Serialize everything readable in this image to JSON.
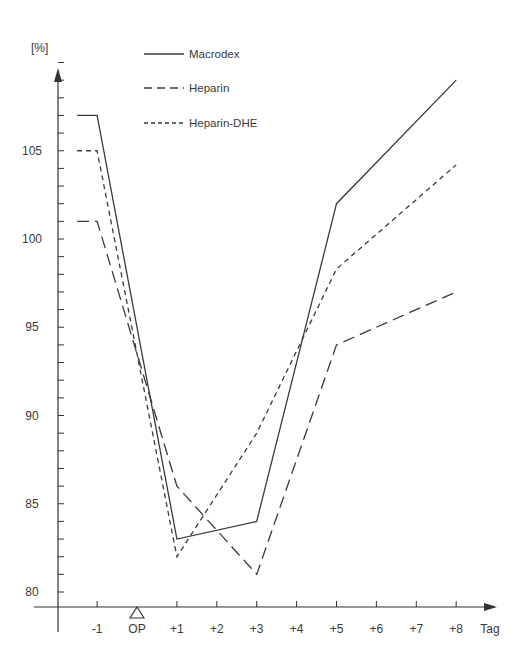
{
  "chart_data": {
    "type": "line",
    "title": "",
    "xlabel": "Tag",
    "ylabel": "[%]",
    "ylim": [
      79,
      111
    ],
    "y_ticks": [
      80,
      85,
      90,
      95,
      100,
      105
    ],
    "y_minor_step": 1,
    "x_ticks": [
      "-1",
      "OP",
      "+1",
      "+2",
      "+3",
      "+4",
      "+5",
      "+6",
      "+7",
      "+8"
    ],
    "x_tick_values": [
      -1,
      0,
      1,
      2,
      3,
      4,
      5,
      6,
      7,
      8
    ],
    "op_marker": "triangle",
    "grid": false,
    "legend_position": "top-center",
    "x": [
      -1,
      1,
      3,
      5,
      8
    ],
    "series": [
      {
        "name": "Macrodex",
        "style": "solid",
        "values": [
          107,
          83,
          84,
          102,
          109
        ]
      },
      {
        "name": "Heparin",
        "style": "long-dash",
        "values": [
          101,
          86,
          81,
          94,
          97
        ]
      },
      {
        "name": "Heparin-DHE",
        "style": "short-dash",
        "values": [
          105,
          82,
          89,
          98.3,
          104.2
        ]
      }
    ]
  },
  "legend": {
    "items": [
      {
        "label": "Macrodex"
      },
      {
        "label": "Heparin"
      },
      {
        "label": "Heparin-DHE"
      }
    ]
  },
  "axes": {
    "y_unit": "[%]",
    "x_unit": "Tag",
    "color": "#333333"
  }
}
